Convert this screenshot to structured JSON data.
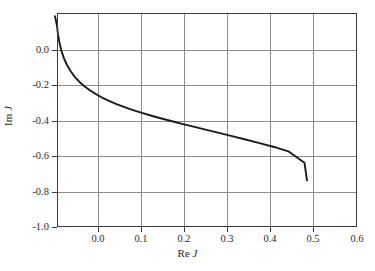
{
  "figure": {
    "background_color": "#ffffff",
    "frame_color": "#3a3a3a",
    "grid_color": "#8c8c8c",
    "curve_color": "#1a1a1a"
  },
  "axis": {
    "x_label_prefix": "Re",
    "x_label_var": "J",
    "y_label_prefix": "Im",
    "y_label_var": "J"
  },
  "chart_data": {
    "type": "line",
    "title": "",
    "subtitle": "",
    "xlabel": "Re J",
    "ylabel": "Im J",
    "xlim": [
      0.0,
      0.6
    ],
    "ylim": [
      -1.0,
      0.0
    ],
    "xticks": [
      0.0,
      0.1,
      0.2,
      0.3,
      0.4,
      0.5,
      0.6
    ],
    "xticklabels": [
      "0.0",
      "0.1",
      "0.2",
      "0.3",
      "0.4",
      "0.5",
      "0.6"
    ],
    "yticks": [
      0.0,
      -0.2,
      -0.4,
      -0.6,
      -0.8,
      -1.0
    ],
    "yticklabels": [
      "0.0",
      "-0.2",
      "-0.4",
      "-0.6",
      "-0.8",
      "-1.0"
    ],
    "grid": true,
    "legend": null,
    "annotations": [],
    "series": [
      {
        "name": "J contour",
        "x": [
          -0.004,
          0.0,
          0.002,
          0.005,
          0.009,
          0.014,
          0.02,
          0.027,
          0.035,
          0.044,
          0.054,
          0.065,
          0.077,
          0.09,
          0.104,
          0.119,
          0.135,
          0.152,
          0.17,
          0.189,
          0.209,
          0.23,
          0.252,
          0.275,
          0.299,
          0.324,
          0.35,
          0.377,
          0.405,
          0.434,
          0.464,
          0.495,
          0.5
        ],
        "y": [
          -0.015,
          -0.06,
          -0.1,
          -0.14,
          -0.178,
          -0.212,
          -0.243,
          -0.271,
          -0.297,
          -0.32,
          -0.341,
          -0.36,
          -0.378,
          -0.395,
          -0.411,
          -0.426,
          -0.44,
          -0.454,
          -0.467,
          -0.48,
          -0.493,
          -0.506,
          -0.519,
          -0.532,
          -0.546,
          -0.56,
          -0.575,
          -0.591,
          -0.608,
          -0.626,
          -0.648,
          -0.7,
          -0.782
        ]
      }
    ]
  }
}
